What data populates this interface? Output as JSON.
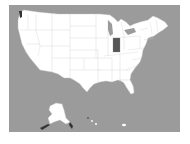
{
  "map": {
    "title": "United States map",
    "highlighted_state": "Indiana",
    "colors": {
      "ocean": "#9b9b9b",
      "land": "#ffffff",
      "border": "#cccccc",
      "highlight": "#555555",
      "page": "#ffffff"
    },
    "insets": [
      "Alaska",
      "Hawaii"
    ]
  }
}
